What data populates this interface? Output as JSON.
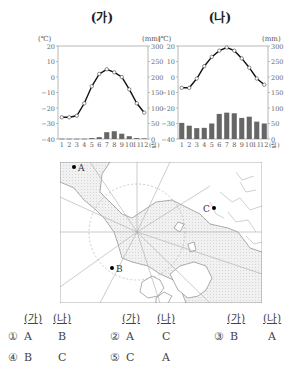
{
  "charts": {
    "ga": {
      "title": "(가)"
    },
    "na": {
      "title": "(나)"
    }
  },
  "chart_data": [
    {
      "type": "line+bar",
      "title": "(가)",
      "xlabel": "(월)",
      "ylabel_left": "(℃)",
      "ylabel_right": "(mm)",
      "categories": [
        "1",
        "2",
        "3",
        "4",
        "5",
        "6",
        "7",
        "8",
        "9",
        "10",
        "11",
        "12"
      ],
      "left_ticks": [
        20,
        10,
        0,
        -10,
        -20,
        -30,
        -40
      ],
      "right_ticks": [
        300,
        250,
        200,
        150,
        100,
        50,
        0
      ],
      "ylim_left": [
        -40,
        20
      ],
      "ylim_right": [
        0,
        300
      ],
      "series": [
        {
          "name": "temperature",
          "type": "line",
          "axis": "left",
          "values": [
            -26,
            -26,
            -25,
            -17,
            -6,
            2,
            5,
            3,
            0,
            -8,
            -17,
            -23
          ]
        },
        {
          "name": "precipitation",
          "type": "bar",
          "axis": "right",
          "values": [
            1,
            1,
            1,
            1,
            3,
            6,
            22,
            25,
            17,
            9,
            3,
            2
          ]
        }
      ]
    },
    {
      "type": "line+bar",
      "title": "(나)",
      "xlabel": "(월)",
      "ylabel_left": "(℃)",
      "ylabel_right": "(mm)",
      "categories": [
        "1",
        "2",
        "3",
        "4",
        "5",
        "6",
        "7",
        "8",
        "9",
        "10",
        "11",
        "12"
      ],
      "left_ticks": [
        20,
        10,
        0,
        -10,
        -20,
        -30,
        -40
      ],
      "right_ticks": [
        300,
        250,
        200,
        150,
        100,
        50,
        0
      ],
      "ylim_left": [
        -40,
        20
      ],
      "ylim_right": [
        0,
        300
      ],
      "series": [
        {
          "name": "temperature",
          "type": "line",
          "axis": "left",
          "values": [
            -7,
            -7,
            -1,
            7,
            13,
            17,
            19,
            17,
            12,
            6,
            -1,
            -5
          ]
        },
        {
          "name": "precipitation",
          "type": "bar",
          "axis": "right",
          "values": [
            52,
            43,
            35,
            36,
            50,
            81,
            85,
            83,
            68,
            72,
            56,
            50
          ]
        }
      ]
    }
  ],
  "map": {
    "points": [
      {
        "label": "A"
      },
      {
        "label": "B"
      },
      {
        "label": "C"
      }
    ]
  },
  "options": {
    "headers": {
      "ga": "(가)",
      "na": "(나)"
    },
    "items": [
      {
        "num": "①",
        "ga": "A",
        "na": "B"
      },
      {
        "num": "②",
        "ga": "A",
        "na": "C"
      },
      {
        "num": "③",
        "ga": "B",
        "na": "A"
      },
      {
        "num": "④",
        "ga": "B",
        "na": "C"
      },
      {
        "num": "⑤",
        "ga": "C",
        "na": "A"
      }
    ]
  },
  "colors": {
    "line": "#111111",
    "bar": "#666666",
    "axis": "#888888",
    "map_ocean": "#ececec",
    "map_land": "#ffffff"
  }
}
